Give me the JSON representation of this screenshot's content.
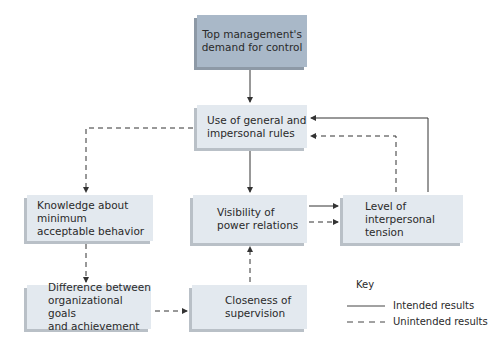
{
  "nodes": {
    "top_demand": "Top management's\ndemand for control",
    "general_rules": "Use of general and\nimpersonal rules",
    "knowledge": "Knowledge about minimum\nacceptable behavior",
    "visibility": "Visibility of\npower relations",
    "tension": "Level of\ninterpersonal tension",
    "difference": "Difference between\norganizational goals\nand achievement",
    "closeness": "Closeness of\nsupervision"
  },
  "key": {
    "title": "Key",
    "intended": "Intended results",
    "unintended": "Unintended results"
  },
  "colors": {
    "top_box": "#a9b8c8",
    "box": "#e3e9ef",
    "line": "#333333"
  }
}
